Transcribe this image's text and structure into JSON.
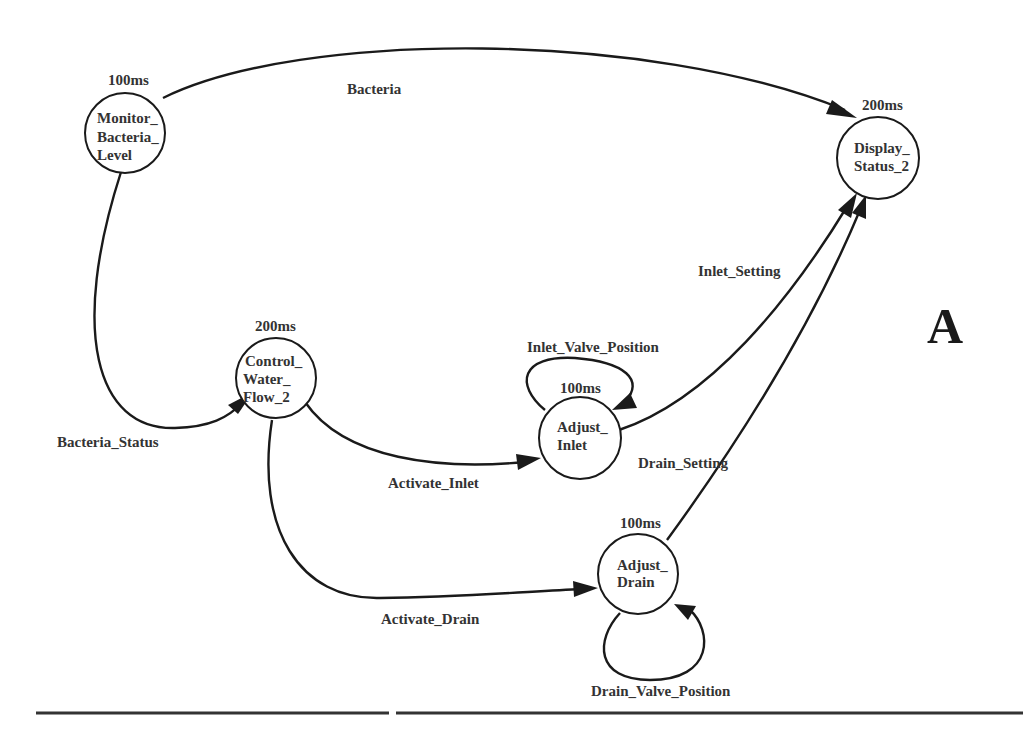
{
  "figure": {
    "panel_letter": "A"
  },
  "nodes": {
    "monitor": {
      "period": "100ms",
      "lines": [
        "Monitor_",
        "Bacteria_",
        "Level"
      ]
    },
    "display": {
      "period": "200ms",
      "lines": [
        "Display_",
        "Status_2"
      ]
    },
    "control": {
      "period": "200ms",
      "lines": [
        "Control_",
        "Water_",
        "Flow_2"
      ]
    },
    "inlet": {
      "period": "100ms",
      "lines": [
        "Adjust_",
        "Inlet"
      ]
    },
    "drain": {
      "period": "100ms",
      "lines": [
        "Adjust_",
        "Drain"
      ]
    }
  },
  "edges": {
    "bacteria": {
      "label": "Bacteria",
      "from": "Monitor_Bacteria_Level",
      "to": "Display_Status_2"
    },
    "bacteria_status": {
      "label": "Bacteria_Status",
      "from": "Monitor_Bacteria_Level",
      "to": "Control_Water_Flow_2"
    },
    "activate_inlet": {
      "label": "Activate_Inlet",
      "from": "Control_Water_Flow_2",
      "to": "Adjust_Inlet"
    },
    "activate_drain": {
      "label": "Activate_Drain",
      "from": "Control_Water_Flow_2",
      "to": "Adjust_Drain"
    },
    "inlet_setting": {
      "label": "Inlet_Setting",
      "from": "Adjust_Inlet",
      "to": "Display_Status_2"
    },
    "drain_setting": {
      "label": "Drain_Setting",
      "from": "Adjust_Drain",
      "to": "Display_Status_2"
    },
    "inlet_valve_position": {
      "label": "Inlet_Valve_Position",
      "from": "Adjust_Inlet",
      "to": "Adjust_Inlet"
    },
    "drain_valve_position": {
      "label": "Drain_Valve_Position",
      "from": "Adjust_Drain",
      "to": "Adjust_Drain"
    }
  }
}
